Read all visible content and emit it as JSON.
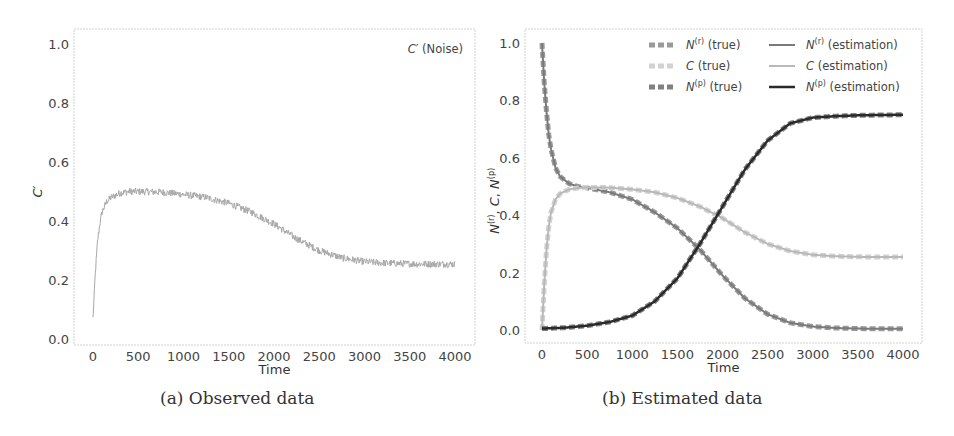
{
  "figure": {
    "captions": [
      "(a) Observed data",
      "(b) Estimated data"
    ]
  },
  "chart_data": [
    {
      "type": "line",
      "id": "observed",
      "title": "",
      "xlabel": "Time",
      "ylabel": "C′",
      "xlim": [
        -150,
        4150
      ],
      "ylim": [
        -0.02,
        1.05
      ],
      "xticks": [
        0,
        500,
        1000,
        1500,
        2000,
        2500,
        3000,
        3500,
        4000
      ],
      "yticks": [
        0.0,
        0.2,
        0.4,
        0.6,
        0.8,
        1.0
      ],
      "ytick_labels": [
        "0.0",
        "0.2",
        "0.4",
        "0.6",
        "0.8",
        "1.0"
      ],
      "grid": false,
      "annotation": "C′ (Noise)",
      "series": [
        {
          "name": "C′ (Noise)",
          "color": "#a8a8a8",
          "noise": 0.012,
          "x": [
            0,
            25,
            50,
            75,
            100,
            150,
            200,
            300,
            400,
            500,
            750,
            1000,
            1250,
            1500,
            1750,
            2000,
            2250,
            2500,
            2750,
            3000,
            3250,
            3500,
            3750,
            4000
          ],
          "y": [
            0.07,
            0.22,
            0.33,
            0.39,
            0.43,
            0.465,
            0.48,
            0.495,
            0.5,
            0.5,
            0.498,
            0.49,
            0.48,
            0.46,
            0.43,
            0.39,
            0.34,
            0.3,
            0.275,
            0.262,
            0.257,
            0.255,
            0.254,
            0.254
          ]
        }
      ]
    },
    {
      "type": "line",
      "id": "estimated",
      "title": "",
      "xlabel": "Time",
      "ylabel": "N(r), C, N(p)",
      "xlim": [
        -150,
        4150
      ],
      "ylim": [
        -0.05,
        1.05
      ],
      "xticks": [
        0,
        500,
        1000,
        1500,
        2000,
        2500,
        3000,
        3500,
        4000
      ],
      "yticks": [
        0.0,
        0.2,
        0.4,
        0.6,
        0.8,
        1.0
      ],
      "ytick_labels": [
        "0.0",
        "0.2",
        "0.4",
        "0.6",
        "0.8",
        "1.0"
      ],
      "grid": false,
      "legend": {
        "position": "upper right",
        "columns": 2,
        "entries": [
          {
            "label_main": "N",
            "label_sup": "(r)",
            "label_rest": " (true)",
            "color": "#9a9a9a",
            "width": 5,
            "dash": "6,3"
          },
          {
            "label_main": "N",
            "label_sup": "(r)",
            "label_rest": " (estimation)",
            "color": "#7a7a7a",
            "width": 2,
            "dash": ""
          },
          {
            "label_main": "C",
            "label_sup": "",
            "label_rest": " (true)",
            "color": "#d2d2d2",
            "width": 5,
            "dash": "6,3"
          },
          {
            "label_main": "C",
            "label_sup": "",
            "label_rest": " (estimation)",
            "color": "#b8b8b8",
            "width": 2,
            "dash": ""
          },
          {
            "label_main": "N",
            "label_sup": "(p)",
            "label_rest": " (true)",
            "color": "#808080",
            "width": 5,
            "dash": "6,3"
          },
          {
            "label_main": "N",
            "label_sup": "(p)",
            "label_rest": " (estimation)",
            "color": "#2a2a2a",
            "width": 2.5,
            "dash": ""
          }
        ]
      },
      "series": [
        {
          "name": "N(r) (true)",
          "color": "#9a9a9a",
          "width": 5,
          "dash": "6,3",
          "x": [
            0,
            25,
            50,
            75,
            100,
            150,
            200,
            300,
            400,
            500,
            750,
            1000,
            1250,
            1500,
            1750,
            2000,
            2250,
            2500,
            2750,
            3000,
            3250,
            3500,
            3750,
            4000
          ],
          "y": [
            1.0,
            0.86,
            0.76,
            0.68,
            0.63,
            0.565,
            0.535,
            0.51,
            0.5,
            0.495,
            0.48,
            0.455,
            0.41,
            0.355,
            0.28,
            0.19,
            0.11,
            0.055,
            0.025,
            0.012,
            0.007,
            0.005,
            0.004,
            0.004
          ]
        },
        {
          "name": "N(r) (estimation)",
          "color": "#7a7a7a",
          "width": 2,
          "dash": "",
          "x": [
            0,
            25,
            50,
            75,
            100,
            150,
            200,
            300,
            400,
            500,
            750,
            1000,
            1250,
            1500,
            1750,
            2000,
            2250,
            2500,
            2750,
            3000,
            3250,
            3500,
            3750,
            4000
          ],
          "y": [
            1.0,
            0.86,
            0.76,
            0.68,
            0.63,
            0.565,
            0.535,
            0.51,
            0.5,
            0.495,
            0.48,
            0.455,
            0.41,
            0.355,
            0.28,
            0.19,
            0.11,
            0.055,
            0.025,
            0.012,
            0.007,
            0.005,
            0.004,
            0.004
          ]
        },
        {
          "name": "C (true)",
          "color": "#d2d2d2",
          "width": 5,
          "dash": "6,3",
          "x": [
            0,
            25,
            50,
            75,
            100,
            150,
            200,
            300,
            400,
            500,
            750,
            1000,
            1250,
            1500,
            1750,
            2000,
            2250,
            2500,
            2750,
            3000,
            3250,
            3500,
            3750,
            4000
          ],
          "y": [
            0.0,
            0.16,
            0.28,
            0.36,
            0.41,
            0.455,
            0.475,
            0.49,
            0.495,
            0.497,
            0.496,
            0.49,
            0.48,
            0.46,
            0.43,
            0.39,
            0.34,
            0.3,
            0.275,
            0.262,
            0.257,
            0.255,
            0.254,
            0.254
          ]
        },
        {
          "name": "C (estimation)",
          "color": "#b8b8b8",
          "width": 2,
          "dash": "",
          "x": [
            0,
            25,
            50,
            75,
            100,
            150,
            200,
            300,
            400,
            500,
            750,
            1000,
            1250,
            1500,
            1750,
            2000,
            2250,
            2500,
            2750,
            3000,
            3250,
            3500,
            3750,
            4000
          ],
          "y": [
            0.0,
            0.16,
            0.28,
            0.36,
            0.41,
            0.455,
            0.475,
            0.49,
            0.495,
            0.497,
            0.496,
            0.49,
            0.48,
            0.46,
            0.43,
            0.39,
            0.34,
            0.3,
            0.275,
            0.262,
            0.257,
            0.255,
            0.254,
            0.254
          ]
        },
        {
          "name": "N(p) (true)",
          "color": "#808080",
          "width": 5,
          "dash": "6,3",
          "x": [
            0,
            250,
            500,
            750,
            1000,
            1250,
            1500,
            1750,
            2000,
            2250,
            2500,
            2750,
            3000,
            3250,
            3500,
            3750,
            4000
          ],
          "y": [
            0.005,
            0.008,
            0.015,
            0.028,
            0.05,
            0.1,
            0.18,
            0.3,
            0.43,
            0.56,
            0.66,
            0.72,
            0.74,
            0.745,
            0.748,
            0.749,
            0.75
          ]
        },
        {
          "name": "N(p) (estimation)",
          "color": "#2a2a2a",
          "width": 2.5,
          "dash": "",
          "x": [
            0,
            250,
            500,
            750,
            1000,
            1250,
            1500,
            1750,
            2000,
            2250,
            2500,
            2750,
            3000,
            3250,
            3500,
            3750,
            4000
          ],
          "y": [
            0.005,
            0.008,
            0.015,
            0.028,
            0.05,
            0.1,
            0.18,
            0.3,
            0.43,
            0.56,
            0.66,
            0.72,
            0.74,
            0.745,
            0.748,
            0.749,
            0.75
          ]
        }
      ]
    }
  ]
}
